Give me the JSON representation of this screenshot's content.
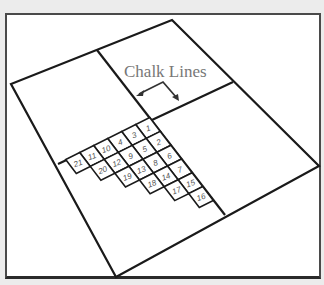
{
  "diagram": {
    "label": "Chalk Lines",
    "colors": {
      "background": "#ececec",
      "panel": "#ffffff",
      "lines": "#1a1a1a",
      "label": "#777777",
      "tile_text": "#555555"
    },
    "floor_outline": [
      [
        172,
        20
      ],
      [
        319,
        166
      ],
      [
        116,
        277
      ],
      [
        11,
        84
      ]
    ],
    "chalk_lines": {
      "vertical": [
        [
          97,
          50
        ],
        [
          225,
          215
        ]
      ],
      "horizontal": [
        [
          58,
          164
        ],
        [
          233,
          82
        ]
      ],
      "intersection": [
        152,
        118
      ]
    },
    "tiles": {
      "origin": [
        148,
        128
      ],
      "row_vector": [
        -14,
        7
      ],
      "column_vector": [
        10.6,
        13.8
      ],
      "grid": [
        [
          1,
          3,
          4,
          10,
          11,
          21
        ],
        [
          2,
          5,
          9,
          12,
          20
        ],
        [
          6,
          8,
          13,
          19
        ],
        [
          7,
          14,
          18
        ],
        [
          15,
          17
        ],
        [
          16
        ]
      ]
    }
  }
}
